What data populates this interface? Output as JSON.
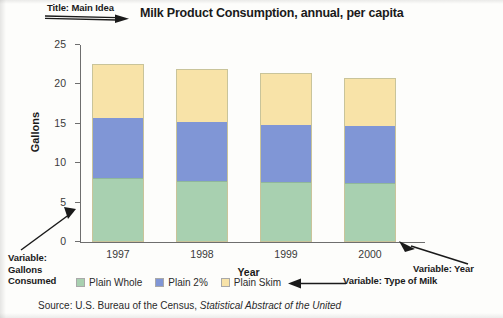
{
  "annotations": {
    "title_note": "Title: Main Idea",
    "gallons_note": "Variable:\nGallons\nConsumed",
    "milk_note": "Variable: Type of Milk",
    "year_note": "Variable: Year"
  },
  "source": {
    "prefix": "Source: U.S. Bureau of the Census, ",
    "italic": "Statistical Abstract of the United"
  },
  "chart_data": {
    "type": "bar",
    "stacked": true,
    "title": "Milk Product Consumption, annual, per capita",
    "xlabel": "Year",
    "ylabel": "Gallons",
    "categories": [
      "1997",
      "1998",
      "1999",
      "2000"
    ],
    "ylim": [
      0,
      25
    ],
    "yticks": [
      0,
      5,
      10,
      15,
      20,
      25
    ],
    "ytick_labels": [
      "0",
      "5",
      "10",
      "15",
      "20",
      "25"
    ],
    "grid": false,
    "legend_position": "bottom",
    "series": [
      {
        "name": "Plain Whole",
        "color": "#a8d0b0",
        "values": [
          8.0,
          7.6,
          7.5,
          7.4
        ]
      },
      {
        "name": "Plain 2%",
        "color": "#8096d6",
        "values": [
          7.9,
          7.7,
          7.5,
          7.4
        ]
      },
      {
        "name": "Plain Skim",
        "color": "#f8e3a8",
        "values": [
          6.7,
          6.7,
          6.4,
          6.0
        ]
      }
    ],
    "totals": [
      22.6,
      22.0,
      21.4,
      20.8
    ]
  }
}
